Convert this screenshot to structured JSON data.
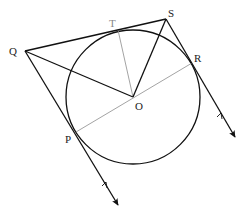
{
  "diagram": {
    "type": "geometry",
    "colors": {
      "stroke": "#111111",
      "thin": "#999999",
      "background": "#ffffff"
    },
    "circle": {
      "center": "O",
      "cx": 133,
      "cy": 97,
      "r": 67
    },
    "points": {
      "Q": {
        "label": "Q",
        "x": 25,
        "y": 51
      },
      "S": {
        "label": "S",
        "x": 166,
        "y": 19
      },
      "T": {
        "label": "T",
        "x": 118,
        "y": 30
      },
      "O": {
        "label": "O",
        "x": 133,
        "y": 97
      },
      "R": {
        "label": "R",
        "x": 192,
        "y": 63
      },
      "P": {
        "label": "P",
        "x": 76,
        "y": 132
      }
    },
    "segments": [
      {
        "from": "Q",
        "to": "S",
        "style": "bold"
      },
      {
        "from": "Q",
        "to": "O",
        "style": "bold"
      },
      {
        "from": "S",
        "to": "O",
        "style": "bold"
      },
      {
        "from": "T",
        "to": "O",
        "style": "thin"
      },
      {
        "from": "P",
        "to": "R",
        "style": "thin",
        "note": "diameter through O"
      }
    ],
    "tangent_rays": [
      {
        "through": [
          "Q",
          "P"
        ],
        "arrow_end": [
          118,
          205
        ],
        "parallel_mark": [
          106,
          184
        ]
      },
      {
        "through": [
          "S",
          "R"
        ],
        "arrow_end": [
          235,
          137
        ],
        "parallel_mark": [
          221,
          115
        ]
      }
    ]
  }
}
